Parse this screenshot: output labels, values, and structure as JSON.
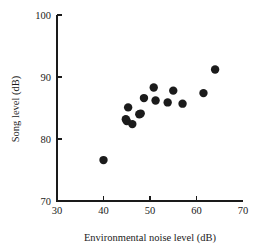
{
  "chart_data": {
    "type": "scatter",
    "title": "",
    "xlabel": "Environmental noise level (dB)",
    "ylabel": "Song level (dB)",
    "xlim": [
      30,
      70
    ],
    "ylim": [
      70,
      100
    ],
    "xticks": [
      30,
      40,
      50,
      60,
      70
    ],
    "yticks": [
      70,
      80,
      90,
      100
    ],
    "xtick_labels": [
      "30",
      "40",
      "50",
      "60",
      "70"
    ],
    "ytick_labels": [
      "70",
      "80",
      "90",
      "100"
    ],
    "grid": false,
    "legend": null,
    "marker": {
      "shape": "circle",
      "color": "#1b1b1b",
      "size": 4.2
    },
    "points": [
      {
        "x": 40.0,
        "y": 76.6
      },
      {
        "x": 44.8,
        "y": 83.2
      },
      {
        "x": 45.0,
        "y": 82.9
      },
      {
        "x": 45.3,
        "y": 85.1
      },
      {
        "x": 46.2,
        "y": 82.4
      },
      {
        "x": 47.7,
        "y": 84.0
      },
      {
        "x": 48.0,
        "y": 84.1
      },
      {
        "x": 48.7,
        "y": 86.6
      },
      {
        "x": 50.8,
        "y": 88.3
      },
      {
        "x": 51.2,
        "y": 86.2
      },
      {
        "x": 53.8,
        "y": 85.9
      },
      {
        "x": 55.0,
        "y": 87.8
      },
      {
        "x": 57.0,
        "y": 85.7
      },
      {
        "x": 61.5,
        "y": 87.4
      },
      {
        "x": 64.0,
        "y": 91.2
      }
    ]
  },
  "axes": {
    "x_axis_name": "x-axis",
    "y_axis_name": "y-axis"
  }
}
